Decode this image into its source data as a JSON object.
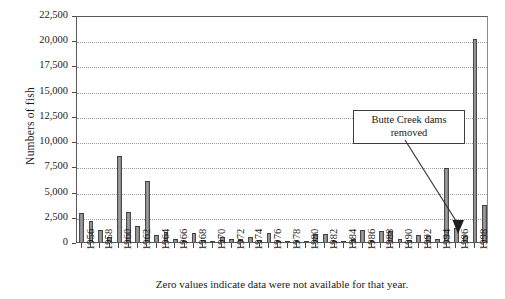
{
  "chart_data": {
    "type": "bar",
    "title": "",
    "subtitle": "",
    "xlabel": "Zero values indicate data were not available for that year.",
    "ylabel": "Numbers of fish",
    "ylim": [
      0,
      22500
    ],
    "ytick_values": [
      0,
      2500,
      5000,
      7500,
      10000,
      12500,
      15000,
      17500,
      20000,
      22500
    ],
    "ytick_labels": [
      "0",
      "2,500",
      "5,000",
      "7,500",
      "10,000",
      "12,500",
      "15,000",
      "17,500",
      "20,000",
      "22,500"
    ],
    "grid": true,
    "legend": null,
    "bar_color": "#8e8e8e",
    "bar_edge_color": "#3d3d3d",
    "categories": [
      "1956",
      "1957",
      "1958",
      "1959",
      "1960",
      "1961",
      "1962",
      "1963",
      "1964",
      "1965",
      "1966",
      "1967",
      "1968",
      "1969",
      "1970",
      "1971",
      "1972",
      "1973",
      "1974",
      "1975",
      "1976",
      "1977",
      "1978",
      "1979",
      "1980",
      "1981",
      "1982",
      "1983",
      "1984",
      "1985",
      "1986",
      "1987",
      "1988",
      "1989",
      "1990",
      "1991",
      "1992",
      "1993",
      "1994",
      "1995",
      "1996",
      "1997",
      "1998",
      "1999"
    ],
    "values": [
      2900,
      2100,
      1200,
      500,
      8500,
      2950,
      1550,
      6000,
      700,
      950,
      250,
      100,
      850,
      200,
      150,
      450,
      300,
      250,
      450,
      200,
      900,
      150,
      100,
      50,
      150,
      750,
      800,
      100,
      50,
      300,
      1200,
      150,
      1100,
      1100,
      250,
      200,
      700,
      550,
      300,
      7300,
      1400,
      600,
      20100,
      3700
    ],
    "xtick_labels": [
      "1956",
      "1958",
      "1960",
      "1962",
      "1964",
      "1966",
      "1968",
      "1970",
      "1972",
      "1974",
      "1976",
      "1978",
      "1980",
      "1982",
      "1984",
      "1986",
      "1988",
      "1990",
      "1992",
      "1994",
      "1996",
      "1998"
    ],
    "annotations": [
      {
        "text": "Butte Creek dams removed",
        "text_line_1": "Butte Creek dams",
        "text_line_2": "removed",
        "points_to_category": "1997"
      }
    ]
  }
}
